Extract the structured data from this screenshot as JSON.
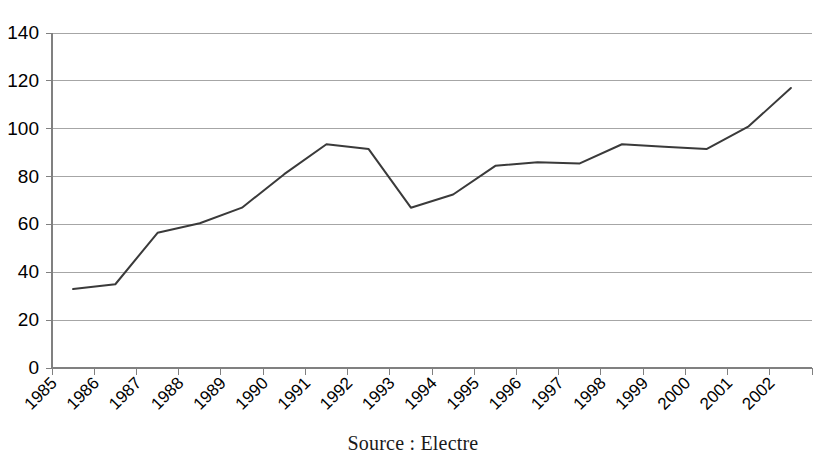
{
  "chart_data": {
    "type": "line",
    "title": "",
    "subtitle": "",
    "xlabel": "",
    "ylabel": "",
    "categories": [
      "1985",
      "1986",
      "1987",
      "1988",
      "1989",
      "1990",
      "1991",
      "1992",
      "1993",
      "1994",
      "1995",
      "1996",
      "1997",
      "1998",
      "1999",
      "2000",
      "2001",
      "2002"
    ],
    "values": [
      33,
      35,
      56.5,
      60.5,
      67,
      81,
      93.5,
      91.5,
      67,
      72.5,
      84.5,
      86,
      85.5,
      93.5,
      92.5,
      91.5,
      101,
      117
    ],
    "series": [
      {
        "name": "",
        "values": [
          33,
          35,
          56.5,
          60.5,
          67,
          81,
          93.5,
          91.5,
          67,
          72.5,
          84.5,
          86,
          85.5,
          93.5,
          92.5,
          91.5,
          101,
          117
        ]
      }
    ],
    "ylim": [
      0,
      140
    ],
    "yticks": [
      0,
      20,
      40,
      60,
      80,
      100,
      120,
      140
    ],
    "ytick_labels": [
      "0",
      "20",
      "40",
      "60",
      "80",
      "100",
      "120",
      "140"
    ],
    "grid": "horizontal",
    "legend": "none",
    "xtick_rotation": 45,
    "line_color": "#3a3a3a",
    "grid_color": "#a6a6a6",
    "background": "#ffffff"
  },
  "caption": {
    "source_text": "Source : Electre"
  }
}
